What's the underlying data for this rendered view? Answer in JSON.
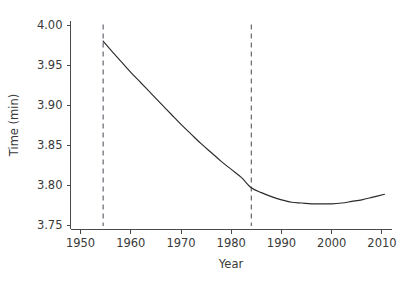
{
  "chart_data": {
    "type": "line",
    "title": "",
    "xlabel": "Year",
    "ylabel": "Time (min)",
    "xlim": [
      1948,
      2012
    ],
    "ylim": [
      3.745,
      4.005
    ],
    "grid": false,
    "legend": "none",
    "x_ticks": [
      1950,
      1960,
      1970,
      1980,
      1990,
      2000,
      2010
    ],
    "x_tick_labels": [
      "1950",
      "1960",
      "1970",
      "1980",
      "1990",
      "2000",
      "2010"
    ],
    "y_ticks": [
      3.75,
      3.8,
      3.85,
      3.9,
      3.95,
      4.0
    ],
    "y_tick_labels": [
      "3.75",
      "3.80",
      "3.85",
      "3.90",
      "3.95",
      "4.00"
    ],
    "series": [
      {
        "name": "fitted-time-curve",
        "color": "#2b2b2b",
        "x": [
          1954.5,
          1956,
          1958,
          1960,
          1962,
          1964,
          1966,
          1968,
          1970,
          1972,
          1974,
          1976,
          1978,
          1980,
          1982,
          1984,
          1986,
          1988,
          1990,
          1992,
          1994,
          1996,
          1998,
          2000,
          2002,
          2004,
          2006,
          2008,
          2010.5
        ],
        "y": [
          3.98,
          3.969,
          3.955,
          3.941,
          3.928,
          3.915,
          3.902,
          3.889,
          3.876,
          3.864,
          3.852,
          3.841,
          3.83,
          3.82,
          3.81,
          3.797,
          3.791,
          3.786,
          3.782,
          3.779,
          3.778,
          3.777,
          3.777,
          3.777,
          3.778,
          3.78,
          3.782,
          3.785,
          3.789
        ]
      }
    ],
    "annotations": [
      {
        "name": "vertical-reference-line-start",
        "type": "vline",
        "x": 1954.5,
        "style": "dashed",
        "color": "#6b6b75",
        "y_from": 3.7495,
        "y_to": 4.0005
      },
      {
        "name": "vertical-reference-line-end",
        "type": "vline",
        "x": 1984.0,
        "style": "dashed",
        "color": "#6b6b75",
        "y_from": 3.7495,
        "y_to": 4.0005
      }
    ]
  },
  "axes": {
    "y_axis_title": "Time (min)",
    "x_axis_title": "Year"
  }
}
